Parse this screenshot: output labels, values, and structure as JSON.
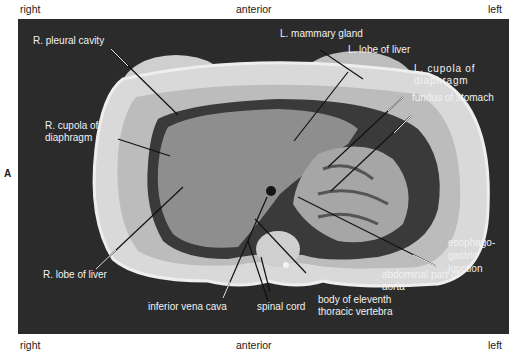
{
  "figure": {
    "panel_letter": "A",
    "orientation": {
      "top_left": "right",
      "top_center": "anterior",
      "top_right": "left",
      "bottom_left": "right",
      "bottom_center": "anterior",
      "bottom_right": "left"
    },
    "labels": {
      "l_mammary_gland": "L. mammary gland",
      "l_lobe_of_liver": "L. lobe of liver",
      "l_cupola_line1": "L. cupola of",
      "l_cupola_line2": "diaphragm",
      "fundus_of_stomach": "fundus of stomach",
      "r_pleural_cavity": "R. pleural cavity",
      "r_cupola_line1": "R. cupola of",
      "r_cupola_line2": "diaphragm",
      "r_lobe_of_liver": "R. lobe of liver",
      "inferior_vena_cava": "inferior vena cava",
      "spinal_cord": "spinal cord",
      "body_vertebra_line1": "body of eleventh",
      "body_vertebra_line2": "thoracic vertebra",
      "abdominal_aorta_line1": "abdominal part of",
      "abdominal_aorta_line2": "aorta",
      "esophago_line1": "esophago-",
      "esophago_line2": "gastric",
      "esophago_line3": "junction"
    },
    "colors": {
      "background": "#2b2b2b",
      "label_text": "#f2f2f2",
      "leader_line": "#111111",
      "tissue_light": "#d8d8d8",
      "liver": "#8c8c8c"
    }
  }
}
